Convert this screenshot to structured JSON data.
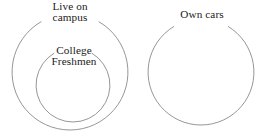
{
  "diagram": {
    "type": "euler-diagram",
    "stroke_color": "#8a8a8a",
    "text_color": "#1a1a1a",
    "background_color": "#ffffff",
    "sets": [
      {
        "name": "live-on-campus",
        "label_line1": "Live on",
        "label_line2": "campus",
        "shape": "circle",
        "center_x": 70,
        "center_y": 72,
        "radius": 58,
        "relation": "contains college-freshmen"
      },
      {
        "name": "college-freshmen",
        "label_line1": "College",
        "label_line2": "Freshmen",
        "shape": "circle",
        "center_x": 73,
        "center_y": 85,
        "radius": 37,
        "relation": "subset of live-on-campus"
      },
      {
        "name": "own-cars",
        "label_line1": "Own cars",
        "label_line2": "",
        "shape": "circle",
        "center_x": 201,
        "center_y": 72,
        "radius": 53,
        "relation": "disjoint from live-on-campus and college-freshmen"
      }
    ]
  }
}
